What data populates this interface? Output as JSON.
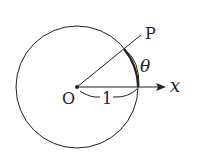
{
  "diagram": {
    "labels": {
      "point": "P",
      "origin": "O",
      "angle": "θ",
      "axis": "x",
      "radius": "1"
    },
    "colors": {
      "stroke": "#222222",
      "background": "#ffffff"
    }
  }
}
